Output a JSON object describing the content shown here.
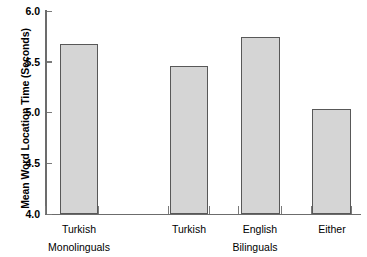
{
  "chart_data": {
    "type": "bar",
    "title": "",
    "xlabel": "",
    "ylabel": "Mean Word Location Time (Seconds)",
    "ylim": [
      4.0,
      6.0
    ],
    "ytick_labels": [
      "4.0",
      "4.5",
      "5.0",
      "5.5",
      "6.0"
    ],
    "ytick_values": [
      4.0,
      4.5,
      5.0,
      5.5,
      6.0
    ],
    "grid": false,
    "legend": null,
    "categories": [
      "Turkish",
      "Turkish",
      "English",
      "Either"
    ],
    "values": [
      5.67,
      5.46,
      5.74,
      5.03
    ],
    "groups": [
      {
        "label": "Monolinguals",
        "categories": [
          "Turkish"
        ]
      },
      {
        "label": "Bilinguals",
        "categories": [
          "Turkish",
          "English",
          "Either"
        ]
      }
    ],
    "bar_fill_color": "#d5d5d5",
    "bar_border_color": "#585858",
    "axis_color": "#6c6c6c"
  },
  "axis": {
    "y_title": "Mean Word Location Time (Seconds)",
    "ticks": [
      {
        "label": "6.0",
        "value": 6.0
      },
      {
        "label": "5.5",
        "value": 5.5
      },
      {
        "label": "5.0",
        "value": 5.0
      },
      {
        "label": "4.5",
        "value": 4.5
      },
      {
        "label": "4.0",
        "value": 4.0
      }
    ]
  },
  "bars": [
    {
      "label": "Turkish",
      "value": 5.67
    },
    {
      "label": "Turkish",
      "value": 5.46
    },
    {
      "label": "English",
      "value": 5.74
    },
    {
      "label": "Either",
      "value": 5.03
    }
  ],
  "groups": [
    {
      "label": "Monolinguals"
    },
    {
      "label": "Bilinguals"
    }
  ]
}
